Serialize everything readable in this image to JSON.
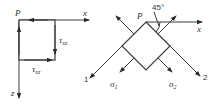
{
  "figure": {
    "left_element": {
      "origin_label": "P",
      "x_axis_label": "x",
      "z_axis_label": "z",
      "shear_right": {
        "symbol": "τ",
        "subscript": "xz"
      },
      "shear_bottom": {
        "symbol": "τ",
        "subscript": "xz"
      }
    },
    "right_element": {
      "origin_label": "P",
      "x_axis_label": "x",
      "angle_label": "45°",
      "direction_1_label": "1",
      "direction_2_label": "2",
      "stress_left": {
        "symbol": "σ",
        "subscript": "1"
      },
      "stress_right": {
        "symbol": "σ",
        "subscript": "2"
      }
    }
  },
  "colors": {
    "line": "#3a3a3a",
    "text": "#333333",
    "background": "#ffffff"
  }
}
